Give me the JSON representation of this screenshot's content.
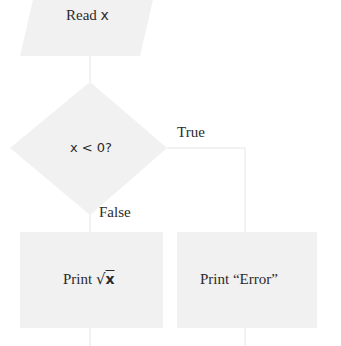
{
  "flowchart": {
    "nodes": {
      "input": {
        "shape": "parallelogram",
        "label_prefix": "Read ",
        "label_var": "x"
      },
      "decision": {
        "shape": "diamond",
        "label": "x < 0?"
      },
      "print_sqrt": {
        "shape": "rectangle",
        "label_prefix": "Print ",
        "label_sqrt": "√",
        "label_var": "x"
      },
      "print_error": {
        "shape": "rectangle",
        "label": "Print “Error”"
      }
    },
    "edges": {
      "true_label": "True",
      "false_label": "False"
    }
  },
  "colors": {
    "shape_fill": "#f1f1f1",
    "connector": "#e6e6e6",
    "text": "#2b2b2b"
  }
}
